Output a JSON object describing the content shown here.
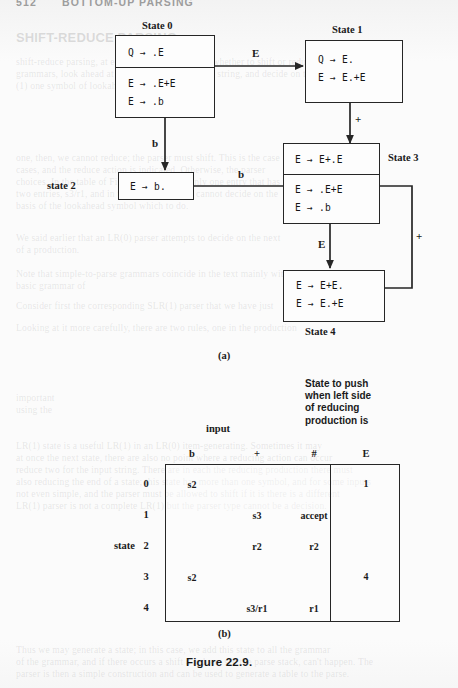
{
  "page": {
    "running_head_number": "512",
    "running_head_title": "BOTTOM-UP PARSING",
    "figure_caption": "Figure 22.9.",
    "caption_a": "(a)",
    "caption_b": "(b)"
  },
  "automaton": {
    "states": [
      {
        "id": "state-0",
        "label": "State 0",
        "label_position": "top",
        "kernel_items": [
          "Q  →  .E"
        ],
        "closure_items": [
          "E  →  .E+E",
          "E  →  .b"
        ]
      },
      {
        "id": "state-1",
        "label": "State 1",
        "label_position": "top",
        "kernel_items": [
          "Q  →  E.",
          "E  →  E.+E"
        ],
        "closure_items": []
      },
      {
        "id": "state-2",
        "label": "state 2",
        "label_position": "left",
        "kernel_items": [
          "E  →  b."
        ],
        "closure_items": []
      },
      {
        "id": "state-3",
        "label": "State 3",
        "label_position": "right",
        "kernel_items": [
          "E  →  E+.E"
        ],
        "closure_items": [
          "E  →  .E+E",
          "E  →  .b"
        ]
      },
      {
        "id": "state-4",
        "label": "State 4",
        "label_position": "bottom",
        "kernel_items": [
          "E  →  E+E.",
          "E  →  E.+E"
        ],
        "closure_items": []
      }
    ],
    "transitions": [
      {
        "id": "t0-1",
        "from": "state-0",
        "to": "state-1",
        "symbol": "E"
      },
      {
        "id": "t0-2",
        "from": "state-0",
        "to": "state-2",
        "symbol": "b"
      },
      {
        "id": "t1-3",
        "from": "state-1",
        "to": "state-3",
        "symbol": "+"
      },
      {
        "id": "t3-2",
        "from": "state-3",
        "to": "state-2",
        "symbol": "b"
      },
      {
        "id": "t3-4",
        "from": "state-3",
        "to": "state-4",
        "symbol": "E"
      },
      {
        "id": "t4-3",
        "from": "state-4",
        "to": "state-3",
        "symbol": "+"
      }
    ]
  },
  "parse_table": {
    "input_group_label": "input",
    "goto_group_note": [
      "State to push",
      "when left side",
      "of reducing",
      "production is"
    ],
    "state_axis_label": "state",
    "input_columns": [
      "b",
      "+",
      "#"
    ],
    "goto_columns": [
      "E"
    ],
    "rows": [
      {
        "state": "0",
        "actions": [
          "s2",
          "",
          ""
        ],
        "goto": [
          "1"
        ]
      },
      {
        "state": "1",
        "actions": [
          "",
          "s3",
          "accept"
        ],
        "goto": [
          ""
        ]
      },
      {
        "state": "2",
        "actions": [
          "",
          "r2",
          "r2"
        ],
        "goto": [
          ""
        ]
      },
      {
        "state": "3",
        "actions": [
          "s2",
          "",
          ""
        ],
        "goto": [
          "4"
        ]
      },
      {
        "state": "4",
        "actions": [
          "",
          "s3/r1",
          "r1"
        ],
        "goto": [
          ""
        ]
      }
    ]
  },
  "ghost_text": [
    {
      "id": "g1",
      "x": 16,
      "y": 30,
      "text": "SHIFT-REDUCE PARSING",
      "bold": true,
      "size": 13
    },
    {
      "id": "g2",
      "x": 16,
      "y": 56,
      "text": "shift-reduce parsing, at each point how to decide whether to shift or reduce. There is, for most",
      "bold": false,
      "size": 9.6
    },
    {
      "id": "g3",
      "x": 16,
      "y": 68,
      "text": "grammars, look ahead at the next part of the input string, and decide on the basis of the",
      "bold": false,
      "size": 9.6
    },
    {
      "id": "g4",
      "x": 16,
      "y": 80,
      "text": "(1) one symbol of lookahead is enough.",
      "bold": false,
      "size": 9.6
    },
    {
      "id": "g5",
      "x": 16,
      "y": 152,
      "text": "one, then, we cannot reduce; the parser must shift. This is the case",
      "bold": false,
      "size": 9.6
    },
    {
      "id": "g6",
      "x": 16,
      "y": 164,
      "text": "cases, and the reduce action is indicated. Otherwise, the parser",
      "bold": false,
      "size": 9.6
    },
    {
      "id": "g7",
      "x": 16,
      "y": 176,
      "text": "choices. In the table of Figure 22.9 there is only one entry that has",
      "bold": false,
      "size": 9.6
    },
    {
      "id": "g8",
      "x": 16,
      "y": 188,
      "text": "two entries, s3/r1, and in that case the parser cannot decide on the",
      "bold": false,
      "size": 9.6
    },
    {
      "id": "g9",
      "x": 16,
      "y": 200,
      "text": "basis of the lookahead symbol which to do.",
      "bold": false,
      "size": 9.6
    },
    {
      "id": "g10",
      "x": 16,
      "y": 232,
      "text": "We said earlier that an LR(0) parser attempts to decide on the next",
      "bold": false,
      "size": 9.6
    },
    {
      "id": "g11",
      "x": 16,
      "y": 244,
      "text": "of a production.",
      "bold": false,
      "size": 9.6
    },
    {
      "id": "g12",
      "x": 16,
      "y": 268,
      "text": "Note that simple-to-parse grammars coincide in the text mainly with the",
      "bold": false,
      "size": 9.6
    },
    {
      "id": "g13",
      "x": 16,
      "y": 280,
      "text": "basic grammar of",
      "bold": false,
      "size": 9.6
    },
    {
      "id": "g14",
      "x": 16,
      "y": 300,
      "text": "Consider first the corresponding SLR(1) parser that we have just",
      "bold": false,
      "size": 9.6
    },
    {
      "id": "g15",
      "x": 16,
      "y": 322,
      "text": "Looking at it more carefully, there are two rules, one in the production",
      "bold": false,
      "size": 9.6
    },
    {
      "id": "g16",
      "x": 16,
      "y": 392,
      "text": "important",
      "bold": false,
      "size": 9.6
    },
    {
      "id": "g17",
      "x": 16,
      "y": 404,
      "text": "using the",
      "bold": false,
      "size": 9.6
    },
    {
      "id": "g18",
      "x": 16,
      "y": 440,
      "text": "LR(1) state is a useful LR(1) in an LR(0) item-generating. Sometimes it may",
      "bold": false,
      "size": 9.6
    },
    {
      "id": "g19",
      "x": 16,
      "y": 452,
      "text": "at once the next state, there are also no point where a reducing action can occur",
      "bold": false,
      "size": 9.6
    },
    {
      "id": "g20",
      "x": 16,
      "y": 464,
      "text": "reduce two for the input string. There are in each the reducing production there must",
      "bold": false,
      "size": 9.6
    },
    {
      "id": "g21",
      "x": 16,
      "y": 476,
      "text": "also reducing the end of a state; this state has more than one symbol, and for some inputs",
      "bold": false,
      "size": 9.6
    },
    {
      "id": "g22",
      "x": 16,
      "y": 488,
      "text": "not even simple, and the parser must be allowed to shift if it is there is a different",
      "bold": false,
      "size": 9.6
    },
    {
      "id": "g23",
      "x": 16,
      "y": 500,
      "text": "LR(1) parser is not a complete LR(1) but the parser type cannot be a decision.",
      "bold": false,
      "size": 9.6
    },
    {
      "id": "g24",
      "x": 16,
      "y": 644,
      "text": "Thus we may generate a state; in this case, we add this state to all the grammar",
      "bold": false,
      "size": 9.6
    },
    {
      "id": "g25",
      "x": 16,
      "y": 656,
      "text": "of the grammar, and if there occurs a shift a reduce, see the parse stack, can't happen. The",
      "bold": false,
      "size": 9.6
    },
    {
      "id": "g26",
      "x": 16,
      "y": 668,
      "text": "parser is then a simple construction and can be used to generate a table to the parse.",
      "bold": false,
      "size": 9.6
    }
  ]
}
